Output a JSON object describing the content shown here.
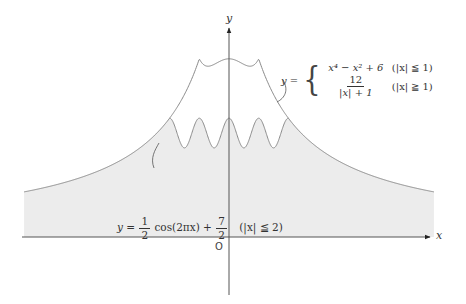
{
  "figure": {
    "title": "",
    "width": 466,
    "height": 304,
    "origin_px": [
      229,
      237
    ],
    "unit_px": 29.7,
    "x_range": [
      -6.9,
      6.9
    ],
    "colors": {
      "fill": "#ececec",
      "curve": "#8a8a8a",
      "axis": "#555555",
      "text": "#333333"
    }
  },
  "axes": {
    "x_label": "x",
    "y_label": "y",
    "origin_label": "O"
  },
  "curves": {
    "upper": {
      "name": "piecewise",
      "prefix": "y =",
      "cases": [
        {
          "expr_main": "x⁴ − x² + 6",
          "condition": "(|x| ≦ 1)"
        },
        {
          "expr_num": "12",
          "expr_den": "|x| + 1",
          "condition": "(|x| ≧ 1)"
        }
      ]
    },
    "lower": {
      "name": "cosine",
      "prefix": "y =",
      "coef_num": "1",
      "coef_den": "2",
      "func": "cos(2πx) +",
      "const_num": "7",
      "const_den": "2",
      "condition": "(|x| ≦ 2)"
    }
  },
  "chart_data": {
    "type": "line",
    "title": "",
    "xlabel": "x",
    "ylabel": "y",
    "series": [
      {
        "name": "y = x^4 - x^2 + 6 (|x| ≤ 1); y = 12/(|x|+1) (|x| ≥ 1)",
        "domain": [
          -6.9,
          6.9
        ],
        "key_points": [
          [
            -6.9,
            1.52
          ],
          [
            -2,
            4
          ],
          [
            -1,
            6
          ],
          [
            -0.707,
            5.75
          ],
          [
            0,
            6
          ],
          [
            0.707,
            5.75
          ],
          [
            1,
            6
          ],
          [
            2,
            4
          ],
          [
            6.9,
            1.52
          ]
        ]
      },
      {
        "name": "y = 1/2 cos(2πx) + 7/2 (|x| ≤ 2)",
        "domain": [
          -2,
          2
        ],
        "key_points": [
          [
            -2,
            4
          ],
          [
            -1.5,
            3
          ],
          [
            -1,
            4
          ],
          [
            -0.5,
            3
          ],
          [
            0,
            4
          ],
          [
            0.5,
            3
          ],
          [
            1,
            4
          ],
          [
            1.5,
            3
          ],
          [
            2,
            4
          ]
        ]
      }
    ],
    "shaded_region": "between x-axis and min(upper curve, cosine curve for |x|≤2)",
    "grid": false,
    "legend": "none"
  }
}
